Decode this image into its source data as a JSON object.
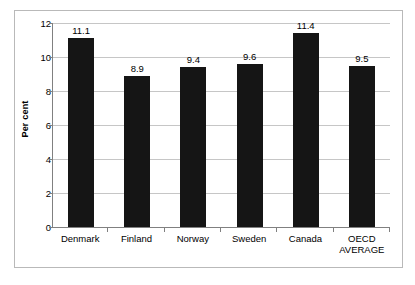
{
  "chart_data": {
    "type": "bar",
    "title": "",
    "subtitle": "",
    "xlabel": "",
    "ylabel": "Per cent",
    "ylim": [
      0,
      12
    ],
    "ytick_step": 2,
    "yticks": [
      "12",
      "10",
      "8",
      "6",
      "4",
      "2",
      "0"
    ],
    "grid": true,
    "legend": false,
    "categories": [
      "Denmark",
      "Finland",
      "Norway",
      "Sweden",
      "Canada",
      "OECD AVERAGE"
    ],
    "category_lines": [
      [
        "Denmark"
      ],
      [
        "Finland"
      ],
      [
        "Norway"
      ],
      [
        "Sweden"
      ],
      [
        "Canada"
      ],
      [
        "OECD",
        "AVERAGE"
      ]
    ],
    "values": [
      11.1,
      8.9,
      9.4,
      9.6,
      11.4,
      9.5
    ],
    "data_labels": [
      "11.1",
      "8.9",
      "9.4",
      "9.6",
      "11.4",
      "9.5"
    ],
    "bar_color": "#151515",
    "gridline_color": "#c6c6c6",
    "axis_color": "#808080",
    "plot_background": "#ffffff",
    "border_color": "#b9b9b9"
  }
}
